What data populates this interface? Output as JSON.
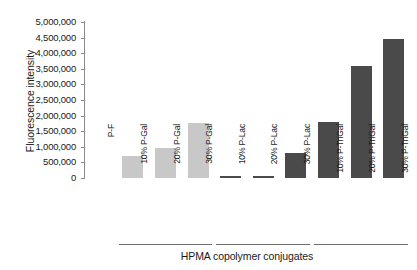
{
  "chart_data": {
    "type": "bar",
    "title": "",
    "xlabel": "HPMA copolymer conjugates",
    "ylabel": "Fluorescence intensity",
    "ylim": [
      0,
      5000000
    ],
    "grid": false,
    "legend": "none",
    "y_ticks": [
      "5,000,000",
      "4,500,000",
      "4,000,000",
      "3,500,000",
      "3,000,000",
      "2,500,000",
      "2,000,000",
      "1,500,000",
      "1,000,000",
      "500,000",
      "0"
    ],
    "y_tick_values": [
      5000000,
      4500000,
      4000000,
      3500000,
      3000000,
      2500000,
      2000000,
      1500000,
      1000000,
      500000,
      0
    ],
    "categories": [
      "P-F",
      "10% P-Gal",
      "20% P-Gal",
      "30% P-Gal",
      "10% P-Lac",
      "20% P-Lac",
      "30% P-Lac",
      "10% P-TriGal",
      "20% P-TriGal",
      "30% P-TriGal"
    ],
    "values": [
      0,
      700000,
      950000,
      1750000,
      50000,
      50000,
      800000,
      1800000,
      3600000,
      4450000
    ],
    "bar_colors": [
      "#c8c8c8",
      "#c8c8c8",
      "#c8c8c8",
      "#c8c8c8",
      "#4a4a4a",
      "#4a4a4a",
      "#4a4a4a",
      "#4a4a4a",
      "#4a4a4a",
      "#4a4a4a"
    ],
    "groups": [
      {
        "label": "P-Gal group",
        "start": 1,
        "end": 3
      },
      {
        "label": "P-Lac group",
        "start": 4,
        "end": 6
      },
      {
        "label": "P-TriGal group",
        "start": 7,
        "end": 9
      }
    ],
    "colors": {
      "light_bar": "#c8c8c8",
      "dark_bar": "#4a4a4a",
      "axis": "#8a8a8a",
      "text": "#1a1a1a",
      "background": "#ffffff"
    }
  }
}
